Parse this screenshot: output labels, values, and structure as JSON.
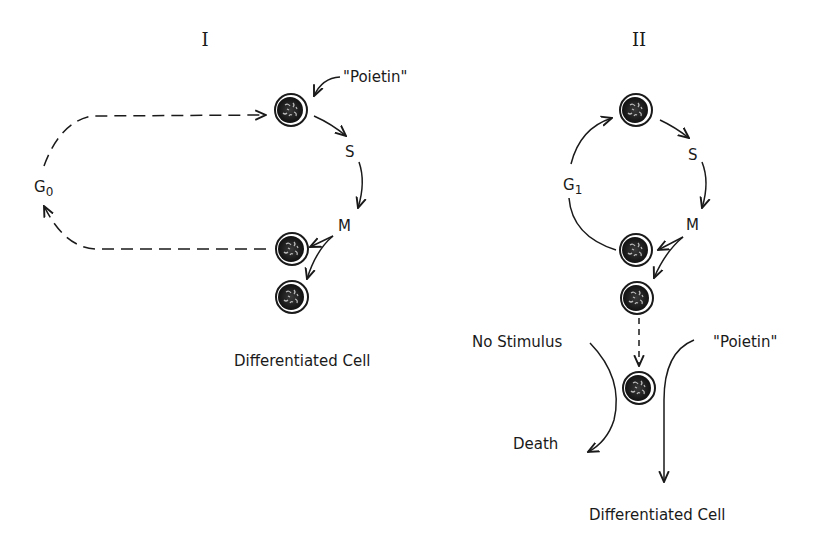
{
  "panels": [
    {
      "id": "I",
      "title": "I",
      "labels": {
        "stimulus": "\"Poietin\"",
        "s_phase": "S",
        "m_phase": "M",
        "rest_phase": "G",
        "rest_phase_sub": "0",
        "outcome": "Differentiated Cell"
      }
    },
    {
      "id": "II",
      "title": "II",
      "labels": {
        "s_phase": "S",
        "m_phase": "M",
        "g1_phase": "G",
        "g1_phase_sub": "1",
        "no_stimulus": "No Stimulus",
        "death": "Death",
        "stimulus": "\"Poietin\"",
        "outcome": "Differentiated Cell"
      }
    }
  ],
  "colors": {
    "ink": "#1a1a1a",
    "background": "#ffffff"
  }
}
